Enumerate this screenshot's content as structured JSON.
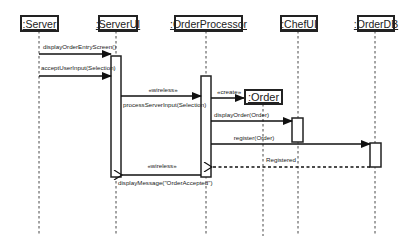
{
  "diagram": {
    "type": "uml-sequence",
    "participants": [
      {
        "id": "server",
        "label": ":Server"
      },
      {
        "id": "serverui",
        "label": ":ServerUI"
      },
      {
        "id": "orderprocessor",
        "label": ":OrderProcessor"
      },
      {
        "id": "chefui",
        "label": ":ChefUI"
      },
      {
        "id": "orderdb",
        "label": ":OrderDB"
      }
    ],
    "created_object": {
      "id": "order",
      "label": ":Order"
    },
    "messages": [
      {
        "from": "server",
        "to": "serverui",
        "label": "displayOrderEntryScreen()",
        "kind": "sync"
      },
      {
        "from": "server",
        "to": "serverui",
        "label": "acceptUserInput(Selection)",
        "kind": "sync"
      },
      {
        "from": "serverui",
        "to": "orderprocessor",
        "stereotype": "«wireless»",
        "label": "processServerInput(Selection)",
        "kind": "sync"
      },
      {
        "from": "orderprocessor",
        "to": "order",
        "stereotype": "«create»",
        "label": "",
        "kind": "create"
      },
      {
        "from": "orderprocessor",
        "to": "chefui",
        "label": "displayOrder(Order)",
        "kind": "sync"
      },
      {
        "from": "orderprocessor",
        "to": "orderdb",
        "label": "register(Order)",
        "kind": "sync"
      },
      {
        "from": "orderdb",
        "to": "orderprocessor",
        "label": "Registered",
        "kind": "return"
      },
      {
        "from": "orderprocessor",
        "to": "serverui",
        "stereotype": "«wireless»",
        "label": "displayMessage(\"OrderAccepted\")",
        "kind": "async"
      }
    ]
  }
}
